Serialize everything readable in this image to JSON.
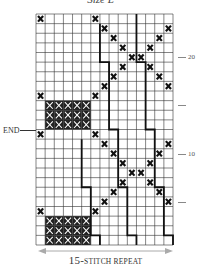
{
  "title": "Size L",
  "grid": {
    "columns": 15,
    "rows": 24,
    "cross_stitches": [
      [
        0,
        0
      ],
      [
        0,
        6
      ],
      [
        1,
        7
      ],
      [
        1,
        14
      ],
      [
        2,
        8
      ],
      [
        2,
        13
      ],
      [
        3,
        9
      ],
      [
        3,
        12
      ],
      [
        4,
        10
      ],
      [
        4,
        11
      ],
      [
        5,
        9
      ],
      [
        5,
        12
      ],
      [
        6,
        8
      ],
      [
        6,
        13
      ],
      [
        7,
        7
      ],
      [
        7,
        14
      ],
      [
        8,
        0
      ],
      [
        8,
        6
      ],
      [
        12,
        0
      ],
      [
        12,
        6
      ],
      [
        13,
        7
      ],
      [
        13,
        14
      ],
      [
        14,
        8
      ],
      [
        14,
        13
      ],
      [
        15,
        9
      ],
      [
        15,
        12
      ],
      [
        16,
        10
      ],
      [
        16,
        11
      ],
      [
        17,
        9
      ],
      [
        17,
        12
      ],
      [
        18,
        8
      ],
      [
        18,
        13
      ],
      [
        19,
        7
      ],
      [
        19,
        14
      ],
      [
        20,
        0
      ],
      [
        20,
        6
      ]
    ],
    "filled_blocks": [
      {
        "row_start": 9,
        "row_end": 11,
        "col_start": 1,
        "col_end": 5
      },
      {
        "row_start": 21,
        "row_end": 23,
        "col_start": 1,
        "col_end": 5
      }
    ],
    "repeat_lines": [
      [
        [
          0,
          4,
          11
        ],
        [
          5,
          11,
          12
        ],
        [
          12,
          17,
          13
        ],
        [
          18,
          22,
          14
        ],
        [
          23,
          23,
          15
        ]
      ],
      [
        [
          1,
          4,
          7
        ],
        [
          5,
          11,
          8
        ],
        [
          12,
          17,
          9
        ],
        [
          18,
          22,
          10
        ],
        [
          23,
          23,
          11
        ]
      ],
      [
        [
          13,
          17,
          5
        ],
        [
          18,
          22,
          6
        ],
        [
          23,
          23,
          7
        ]
      ]
    ]
  },
  "row_markers": [
    {
      "label": "20",
      "row_from_bottom": 20
    },
    {
      "label": "",
      "row_from_bottom": 15
    },
    {
      "label": "10",
      "row_from_bottom": 10
    },
    {
      "label": "",
      "row_from_bottom": 5
    }
  ],
  "end_label": "END",
  "repeat_label": {
    "number": "15-",
    "text": "STITCH REPEAT"
  },
  "colors": {
    "grid_line": "#333333",
    "cross": "#111111",
    "repeat_line": "#111111",
    "arrow": "#aaaaaa"
  }
}
